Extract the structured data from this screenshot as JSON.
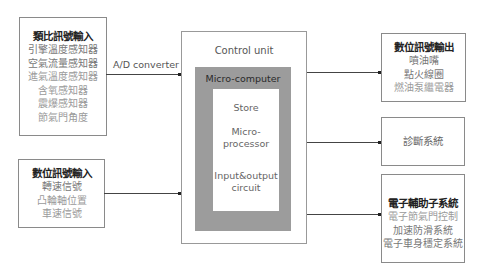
{
  "inputs": {
    "analog": {
      "title": "類比訊號輸入",
      "items": [
        "引擎溫度感知器",
        "空氣流量感知器",
        "進氣溫度感知器",
        "含氧感知器",
        "震爆感知器",
        "節氣門角度"
      ]
    },
    "digital": {
      "title": "數位訊號輸入",
      "items": [
        "轉速信號",
        "凸輪軸位置",
        "車速信號"
      ]
    }
  },
  "connector_label": "A/D converter",
  "control_unit": {
    "title": "Control unit",
    "micro_computer": {
      "title": "Micro-computer",
      "store": "Store",
      "processor_line1": "Micro-",
      "processor_line2": "processor",
      "io_line1": "Input&output",
      "io_line2": "circuit"
    }
  },
  "outputs": {
    "digital": {
      "title": "數位訊號輸出",
      "items": [
        "噴油嘴",
        "點火線圈",
        "燃油泵繼電器"
      ]
    },
    "diagnosis": {
      "title": "診斷系統"
    },
    "electronic_aux": {
      "title": "電子輔助子系統",
      "items": [
        "電子節氣門控制",
        "加速防滑系統",
        "電子車身穩定系統"
      ]
    }
  },
  "colors": {
    "border": "#8a8a8a",
    "micro_computer_fill": "#9c9c9c",
    "line": "#444444"
  }
}
